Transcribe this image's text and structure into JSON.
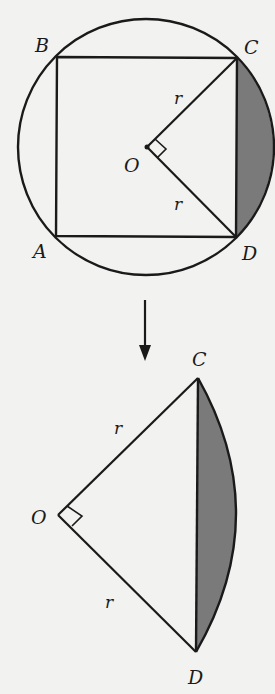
{
  "figure_top": {
    "labels": {
      "A": "A",
      "B": "B",
      "C": "C",
      "D": "D",
      "O": "O",
      "r1": "r",
      "r2": "r"
    }
  },
  "figure_bottom": {
    "labels": {
      "C": "C",
      "D": "D",
      "O": "O",
      "r1": "r",
      "r2": "r"
    }
  },
  "colors": {
    "line": "#1a1a1a",
    "shade": "#7a7a7a",
    "background": "#f2f2f0"
  }
}
